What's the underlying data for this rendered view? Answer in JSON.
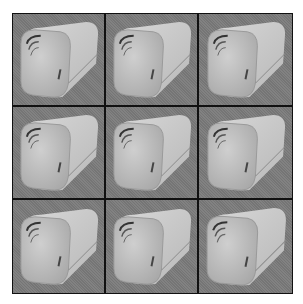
{
  "image": {
    "description": "3x3 grid of grayscale renders of a rounded square tube / bread-loaf-like 3D shape with concentric ridges on the front face",
    "rows": 3,
    "cols": 3,
    "border_color": "#111111",
    "background_color": "#7b7b7b",
    "object_color": "#c4c4c4",
    "cells": [
      {
        "id": "r1c1"
      },
      {
        "id": "r1c2"
      },
      {
        "id": "r1c3"
      },
      {
        "id": "r2c1"
      },
      {
        "id": "r2c2"
      },
      {
        "id": "r2c3"
      },
      {
        "id": "r3c1"
      },
      {
        "id": "r3c2"
      },
      {
        "id": "r3c3"
      }
    ]
  }
}
